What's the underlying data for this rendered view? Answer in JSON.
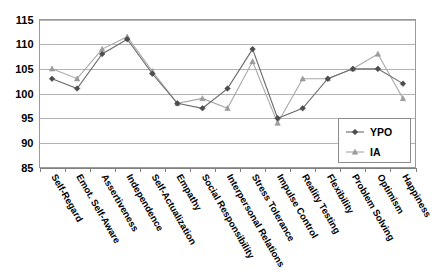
{
  "chart_data": {
    "type": "line",
    "title": "",
    "subtitle": "",
    "xlabel": "",
    "ylabel": "",
    "ylim": [
      85,
      115
    ],
    "ytick_labels": [
      "85",
      "90",
      "95",
      "100",
      "105",
      "110",
      "115"
    ],
    "ytick_values": [
      85,
      90,
      95,
      100,
      105,
      110,
      115
    ],
    "grid": true,
    "legend_position": "bottom-right",
    "categories": [
      "Self-Regard",
      "Emot. Self-Aware",
      "Assertiveness",
      "Independence",
      "Self-Actualization",
      "Empathy",
      "Social Responsibility",
      "Interpersonal Relations",
      "Stress Tolerance",
      "Impulse Control",
      "Reality Testing",
      "Flexibility",
      "Problem Solving",
      "Optimism",
      "Happiness"
    ],
    "series": [
      {
        "name": "YPO",
        "marker": "diamond",
        "color": "#4d4d4d",
        "line_color": "#6b6b6b",
        "values": [
          103,
          101,
          108,
          111,
          104,
          98,
          97,
          101,
          109,
          95,
          97,
          103,
          105,
          105,
          102
        ]
      },
      {
        "name": "IA",
        "marker": "triangle",
        "color": "#9e9e9e",
        "line_color": "#a8a8a8",
        "values": [
          105,
          103,
          109,
          111.5,
          104.5,
          98,
          99,
          97,
          106.5,
          94,
          103,
          103,
          105,
          108,
          99
        ]
      }
    ]
  },
  "legend": {
    "entries": [
      {
        "label": "YPO",
        "marker": "diamond-marker-icon"
      },
      {
        "label": "IA",
        "marker": "triangle-marker-icon"
      }
    ]
  },
  "axes": {
    "y_axis_name": "score-axis",
    "x_axis_name": "subscale-axis"
  }
}
